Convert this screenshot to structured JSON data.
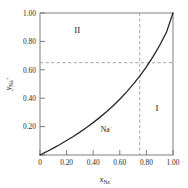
{
  "chart_data": {
    "type": "line",
    "title": "",
    "xlabel": "x_Na+",
    "ylabel": "y_Na+",
    "xlabel_base": "x",
    "xlabel_sub": "Na",
    "xlabel_sup": "+",
    "ylabel_base": "y",
    "ylabel_sub": "Na",
    "ylabel_sup": "+",
    "xlim": [
      0,
      1.0
    ],
    "ylim": [
      0,
      1.0
    ],
    "grid": false,
    "legend": "none",
    "xticks": [
      0,
      0.2,
      0.4,
      0.6,
      0.8,
      1.0
    ],
    "yticks": [
      0,
      0.2,
      0.4,
      0.6,
      0.8,
      1.0
    ],
    "xticklabels": [
      "0",
      "0.20",
      "0.40",
      "0.60",
      "0.80",
      "1.00"
    ],
    "yticklabels": [
      "",
      "0.20",
      "0.40",
      "0.60",
      "0.80",
      "1.00"
    ],
    "series": [
      {
        "name": "Na+ equilibrium curve",
        "color": "#2a2a2a",
        "style": "solid",
        "x": [
          0.0,
          0.05,
          0.1,
          0.15,
          0.2,
          0.25,
          0.3,
          0.35,
          0.4,
          0.45,
          0.5,
          0.55,
          0.6,
          0.65,
          0.7,
          0.75,
          0.8,
          0.85,
          0.9,
          0.95,
          1.0
        ],
        "y": [
          0.0,
          0.023,
          0.048,
          0.074,
          0.102,
          0.13,
          0.161,
          0.194,
          0.228,
          0.265,
          0.305,
          0.347,
          0.393,
          0.443,
          0.497,
          0.556,
          0.621,
          0.693,
          0.773,
          0.862,
          1.0
        ]
      }
    ],
    "guides": [
      {
        "name": "vertical-guide",
        "orientation": "vertical",
        "value": 0.75,
        "color": "#9a9a9a",
        "style": "dashed"
      },
      {
        "name": "horizontal-guide",
        "orientation": "horizontal",
        "value": 0.65,
        "color": "#9a9a9a",
        "style": "dashed"
      }
    ],
    "intersection": {
      "x": 0.75,
      "y": 0.65
    },
    "annotations": [
      {
        "name": "region-two",
        "text": "II",
        "x": 0.28,
        "y": 0.86
      },
      {
        "name": "region-one",
        "text": "I",
        "x": 0.88,
        "y": 0.31
      },
      {
        "name": "species-label",
        "text": "Na",
        "sup": "+",
        "x": 0.5,
        "y": 0.165
      }
    ]
  }
}
